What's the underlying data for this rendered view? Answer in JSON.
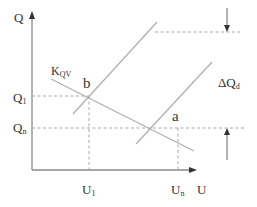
{
  "diagram": {
    "type": "economics-supply-demand-shift",
    "axes": {
      "y_label": "Q",
      "x_label": "U"
    },
    "curves": {
      "demand_label": "K",
      "demand_label_subscript": "QV"
    },
    "points": {
      "b": "b",
      "a": "a"
    },
    "y_ticks": {
      "q1_main": "Q",
      "q1_sub": "1",
      "qn_main": "Q",
      "qn_sub": "n"
    },
    "x_ticks": {
      "u1_main": "U",
      "u1_sub": "1",
      "un_main": "U",
      "un_sub": "n"
    },
    "delta_label": {
      "prefix": "ΔQ",
      "sub": "d"
    }
  }
}
